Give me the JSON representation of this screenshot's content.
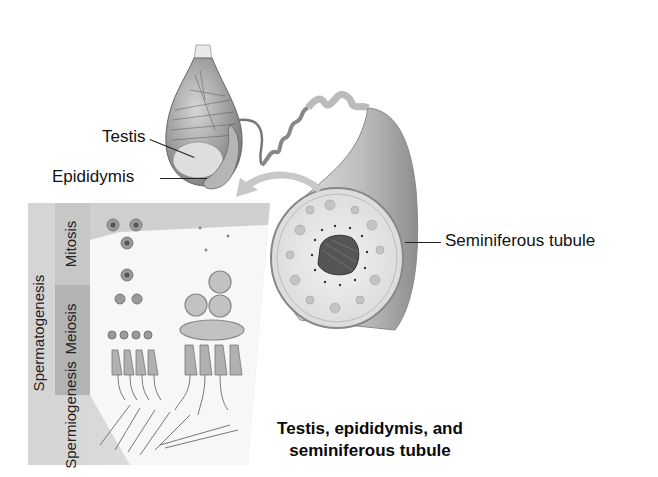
{
  "diagram": {
    "title_fragment_cropped": "",
    "labels": {
      "testis": "Testis",
      "epididymis": "Epididymis",
      "seminiferous_tubule": "Seminiferous tubule"
    },
    "panel": {
      "group_label": "Spermatogenesis",
      "stages": [
        {
          "label": "Mitosis"
        },
        {
          "label": "Meiosis"
        },
        {
          "label": "Spermiogenesis"
        }
      ]
    },
    "caption": {
      "line1": "Testis, epididymis, and",
      "line2": "seminiferous tubule"
    },
    "colors": {
      "background": "#ffffff",
      "panel_band_light": "#d9d9d9",
      "panel_band_mid": "#bdbdbd",
      "tissue_gray": "#a8a8a8",
      "line": "#222222"
    },
    "icons": [
      "testis-illustration",
      "seminiferous-tubule-illustration",
      "curved-arrow-icon",
      "sperm-cell-icons"
    ]
  }
}
